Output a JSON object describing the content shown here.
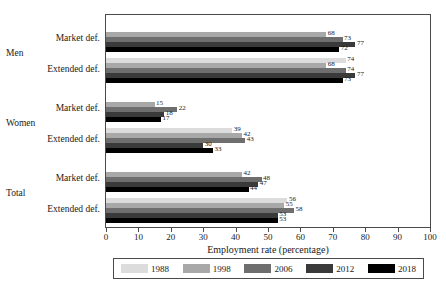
{
  "chart_data": {
    "type": "bar",
    "orientation": "horizontal",
    "title": "",
    "xlabel": "Employment rate (percentage)",
    "ylabel": "",
    "xlim": [
      0,
      100
    ],
    "xticks": [
      0,
      10,
      20,
      30,
      40,
      50,
      60,
      70,
      80,
      90,
      100
    ],
    "grid": false,
    "legend_position": "bottom",
    "series": [
      {
        "name": "1988",
        "color": "#dcdcdc"
      },
      {
        "name": "1998",
        "color": "#a8a8a8"
      },
      {
        "name": "2006",
        "color": "#6e6e6e"
      },
      {
        "name": "2012",
        "color": "#3a3a3a"
      },
      {
        "name": "2018",
        "color": "#000000"
      }
    ],
    "groups": [
      {
        "group": "Men",
        "categories": [
          {
            "label": "Market def.",
            "values": [
              null,
              68,
              73,
              77,
              72
            ]
          },
          {
            "label": "Extended def.",
            "values": [
              74,
              68,
              74,
              77,
              73
            ]
          }
        ]
      },
      {
        "group": "Women",
        "categories": [
          {
            "label": "Market def.",
            "values": [
              null,
              15,
              22,
              18,
              17
            ]
          },
          {
            "label": "Extended def.",
            "values": [
              39,
              42,
              43,
              30,
              33
            ]
          }
        ]
      },
      {
        "group": "Total",
        "categories": [
          {
            "label": "Market def.",
            "values": [
              null,
              42,
              48,
              47,
              44
            ]
          },
          {
            "label": "Extended def.",
            "values": [
              56,
              55,
              58,
              53,
              53
            ]
          }
        ]
      }
    ]
  },
  "axis": {
    "x_title": "Employment rate (percentage)",
    "ticks": [
      "0",
      "10",
      "20",
      "30",
      "40",
      "50",
      "60",
      "70",
      "80",
      "90",
      "100"
    ]
  },
  "legend": {
    "items": [
      {
        "label": "1988",
        "color": "#dcdcdc"
      },
      {
        "label": "1998",
        "color": "#a8a8a8"
      },
      {
        "label": "2006",
        "color": "#6e6e6e"
      },
      {
        "label": "2012",
        "color": "#3a3a3a"
      },
      {
        "label": "2018",
        "color": "#000000"
      }
    ]
  }
}
